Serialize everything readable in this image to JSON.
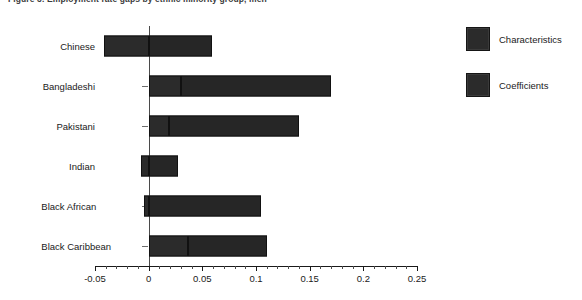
{
  "chart_data": {
    "type": "bar",
    "orientation": "horizontal",
    "stacked": true,
    "title": "Figure 3: Employment rate gaps by ethnic minority group, men",
    "xlabel": "",
    "ylabel": "",
    "xlim": [
      -0.05,
      0.25
    ],
    "xticks": [
      -0.05,
      0,
      0.05,
      0.1,
      0.15,
      0.2,
      0.25
    ],
    "xtick_labels": [
      "-0.05",
      "0",
      "0.05",
      "0.1",
      "0.15",
      "0.2",
      "0.25"
    ],
    "minor_tick_step": 0.01,
    "grid": false,
    "zero_line": 0,
    "legend_position": "right",
    "categories": [
      "Chinese",
      "Bangladeshi",
      "Pakistani",
      "Indian",
      "Black African",
      "Black Caribbean"
    ],
    "series": [
      {
        "name": "Characteristics",
        "color": "#2b2b2b",
        "values": [
          -0.042,
          0.03,
          0.019,
          -0.007,
          -0.004,
          0.037
        ]
      },
      {
        "name": "Coefficients",
        "color": "#262626",
        "values": [
          0.059,
          0.14,
          0.121,
          0.027,
          0.105,
          0.073
        ]
      }
    ],
    "totals": [
      0.017,
      0.17,
      0.14,
      0.02,
      0.101,
      0.11
    ]
  },
  "legend": {
    "items": [
      {
        "label": "Characteristics",
        "swatch": "legend-swatch-characteristics"
      },
      {
        "label": "Coefficients",
        "swatch": "legend-swatch-coefficients"
      }
    ]
  }
}
